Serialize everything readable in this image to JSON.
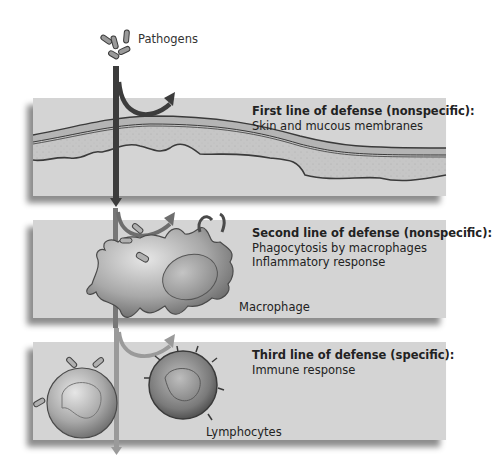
{
  "pathogens": {
    "label": "Pathogens"
  },
  "lines_of_defense": [
    {
      "title": "First line of defense (nonspecific):",
      "items": [
        "Skin and mucous membranes"
      ]
    },
    {
      "title": "Second line of defense (nonspecific):",
      "items": [
        "Phagocytosis by macrophages",
        "Inflammatory response"
      ],
      "cell_label": "Macrophage"
    },
    {
      "title": "Third line of defense (specific):",
      "items": [
        "Immune response"
      ],
      "cell_label": "Lymphocytes"
    }
  ],
  "colors": {
    "background": "#ffffff",
    "panel": "#d4d4d4",
    "arrow_dark": "#3c3c3c",
    "arrow_mid": "#6e6e6e",
    "arrow_light": "#9a9a9a",
    "skin_layer": "#bdbdbd",
    "dermis": "#c8c8c8"
  }
}
